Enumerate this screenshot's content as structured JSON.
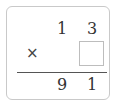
{
  "problem": {
    "multiplicand": {
      "tens": "1",
      "ones": "3"
    },
    "operator": "×",
    "multiplier": {
      "ones": ""
    },
    "product": {
      "tens": "9",
      "ones": "1"
    }
  },
  "colors": {
    "border": "#c9c9c9",
    "text": "#333333",
    "rule": "#555555"
  }
}
